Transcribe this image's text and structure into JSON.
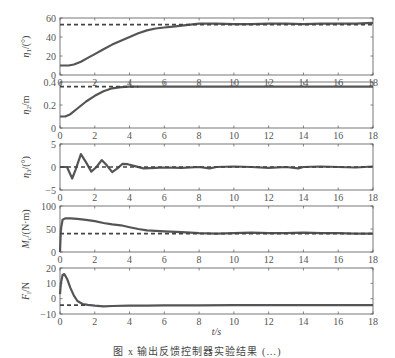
{
  "figure": {
    "caption": "图 x  输出反馈控制器实验结果 (…)",
    "xlabel": "t/s",
    "line_color": "#555555",
    "ref_color": "#444444",
    "axis_color": "#555555"
  },
  "chart_data": [
    {
      "type": "line",
      "title": "",
      "ylabel": "η1/(°)",
      "xlabel": "t/s",
      "xlim": [
        0,
        18
      ],
      "ylim": [
        0,
        60
      ],
      "xticks": [
        0,
        2,
        4,
        6,
        8,
        10,
        12,
        14,
        16,
        18
      ],
      "yticks": [
        0,
        20,
        40,
        60
      ],
      "grid": false,
      "series": [
        {
          "name": "response",
          "style": "solid",
          "x": [
            0,
            0.5,
            0.8,
            1.2,
            1.6,
            2,
            2.5,
            3,
            3.5,
            4,
            4.5,
            5,
            5.5,
            6,
            6.5,
            7,
            7.5,
            8,
            9,
            10,
            11,
            12,
            13,
            14,
            15,
            16,
            17,
            18
          ],
          "y": [
            10,
            10,
            11,
            14,
            18,
            22,
            27,
            32,
            36,
            40,
            44,
            47,
            49,
            50,
            51,
            52,
            53,
            54,
            54,
            53.5,
            53.5,
            54,
            54,
            53.5,
            54,
            54,
            54,
            55
          ]
        },
        {
          "name": "reference",
          "style": "dashed",
          "x": [
            0,
            18
          ],
          "y": [
            53,
            53
          ]
        }
      ]
    },
    {
      "type": "line",
      "ylabel": "η2/m",
      "xlim": [
        0,
        18
      ],
      "ylim": [
        0,
        0.4
      ],
      "xticks": [
        0,
        2,
        4,
        6,
        8,
        10,
        12,
        14,
        16,
        18
      ],
      "yticks": [
        0,
        0.2,
        0.4
      ],
      "grid": false,
      "series": [
        {
          "name": "response",
          "style": "solid",
          "x": [
            0,
            0.3,
            0.6,
            1,
            1.5,
            2,
            2.5,
            3,
            3.5,
            4,
            5,
            6,
            8,
            10,
            12,
            14,
            16,
            18
          ],
          "y": [
            0.1,
            0.1,
            0.12,
            0.17,
            0.23,
            0.28,
            0.32,
            0.345,
            0.355,
            0.36,
            0.36,
            0.36,
            0.36,
            0.36,
            0.36,
            0.36,
            0.36,
            0.36
          ]
        },
        {
          "name": "reference",
          "style": "dashed",
          "x": [
            0,
            4.5
          ],
          "y": [
            0.36,
            0.36
          ]
        }
      ]
    },
    {
      "type": "line",
      "ylabel": "η3/(°)",
      "xlim": [
        0,
        18
      ],
      "ylim": [
        -5,
        5
      ],
      "xticks": [
        0,
        2,
        4,
        6,
        8,
        10,
        12,
        14,
        16,
        18
      ],
      "yticks": [
        -5,
        0,
        5
      ],
      "grid": false,
      "series": [
        {
          "name": "response",
          "style": "solid",
          "x": [
            0,
            0.4,
            0.7,
            0.9,
            1.2,
            1.5,
            1.8,
            2.1,
            2.4,
            2.7,
            3.0,
            3.3,
            3.6,
            3.9,
            4.3,
            4.8,
            5.5,
            6,
            7,
            8,
            8.6,
            9,
            10,
            11,
            12,
            13,
            13.7,
            14,
            15,
            16,
            17,
            18
          ],
          "y": [
            0,
            0,
            -2.5,
            -0.5,
            2.8,
            1,
            -1,
            0,
            1.5,
            0.3,
            -1.1,
            -0.3,
            0.7,
            0.6,
            0.2,
            -0.3,
            -0.2,
            -0.1,
            -0.2,
            0,
            -0.3,
            0,
            0.1,
            0,
            -0.2,
            0,
            -0.3,
            0,
            0.1,
            0,
            -0.1,
            0.1
          ]
        },
        {
          "name": "reference",
          "style": "dashed",
          "x": [
            0,
            18
          ],
          "y": [
            0,
            0
          ]
        }
      ]
    },
    {
      "type": "line",
      "ylabel": "Mc/(N·m)",
      "xlim": [
        0,
        18
      ],
      "ylim": [
        0,
        100
      ],
      "xticks": [
        0,
        2,
        4,
        6,
        8,
        10,
        12,
        14,
        16,
        18
      ],
      "yticks": [
        0,
        50,
        100
      ],
      "grid": false,
      "series": [
        {
          "name": "response",
          "style": "solid",
          "x": [
            0,
            0.05,
            0.15,
            0.3,
            0.6,
            1,
            1.5,
            2,
            2.5,
            3,
            3.5,
            4,
            4.5,
            5,
            5.5,
            6,
            7,
            8,
            9,
            10,
            11,
            12,
            13,
            14,
            15,
            16,
            17,
            18
          ],
          "y": [
            0,
            50,
            70,
            73,
            73,
            72,
            70,
            67,
            63,
            60,
            58,
            54,
            50,
            47,
            46,
            45,
            43,
            41,
            40,
            41,
            42,
            41,
            41,
            42,
            41,
            41,
            40,
            40
          ]
        },
        {
          "name": "reference",
          "style": "dashed",
          "x": [
            0,
            18
          ],
          "y": [
            40,
            40
          ]
        }
      ]
    },
    {
      "type": "line",
      "ylabel": "Fl/N",
      "xlabel": "t/s",
      "xlim": [
        0,
        18
      ],
      "ylim": [
        -10,
        20
      ],
      "xticks": [
        0,
        2,
        4,
        6,
        8,
        10,
        12,
        14,
        16,
        18
      ],
      "yticks": [
        -10,
        0,
        10,
        20
      ],
      "grid": false,
      "series": [
        {
          "name": "response",
          "style": "solid",
          "x": [
            0,
            0.05,
            0.15,
            0.25,
            0.4,
            0.6,
            0.8,
            1,
            1.3,
            1.6,
            2,
            2.5,
            3,
            4,
            5,
            6,
            8,
            10,
            12,
            14,
            16,
            18
          ],
          "y": [
            3,
            10,
            15.5,
            16,
            13,
            7,
            2,
            -1.5,
            -3.5,
            -4,
            -4.5,
            -5,
            -4.8,
            -4.5,
            -4.5,
            -4.3,
            -4.3,
            -4.2,
            -4.2,
            -4.2,
            -4.2,
            -4.2
          ]
        },
        {
          "name": "reference",
          "style": "dashed",
          "x": [
            0,
            1.5
          ],
          "y": [
            -4.2,
            -4.2
          ]
        }
      ]
    }
  ]
}
